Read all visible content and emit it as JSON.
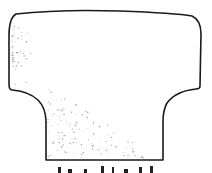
{
  "figure": {
    "type": "line-drawing",
    "stroke_color": "#1a1a1a",
    "stipple_color": "#8a8a8a",
    "background": "#ffffff",
    "outline_path": "M 16 14 Q 60 9 120 11 Q 175 13 192 16 Q 201 20 201 34 L 200 86 Q 200 89 196 89 Q 176 91 167 103 Q 163 110 163 122 L 163 160 L 46 160 L 46 122 Q 46 108 38 100 Q 28 91 12 90 Q 9 90 9 84 L 9 36 Q 9 18 16 14 Z"
  },
  "caption": {
    "text": "",
    "note": "caption text cropped at bottom edge; illegible"
  }
}
